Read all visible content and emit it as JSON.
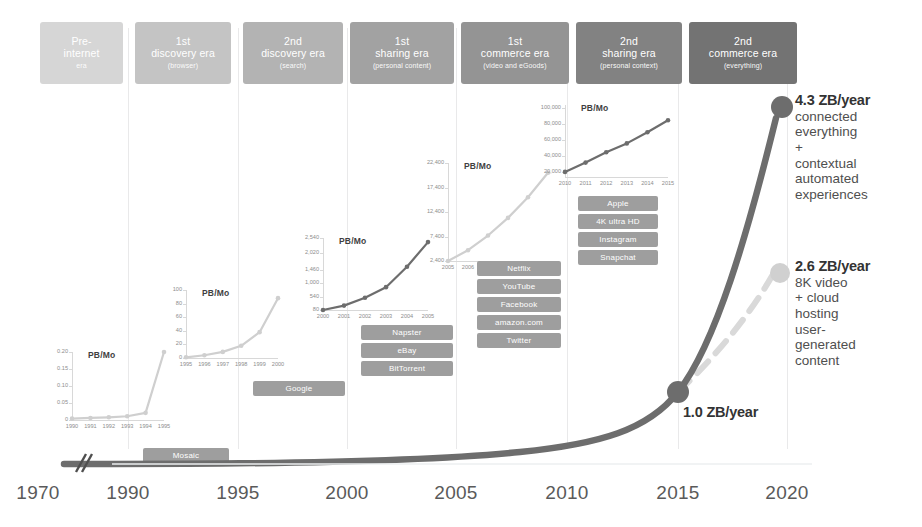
{
  "eras": [
    {
      "top": "Pre-",
      "mid": "internet",
      "sub": "era",
      "color": "#d6d6d6",
      "x": 40,
      "w": 83
    },
    {
      "top": "1st",
      "mid": "discovery era",
      "sub": "(browser)",
      "color": "#c4c4c4",
      "x": 135,
      "w": 96
    },
    {
      "top": "2nd",
      "mid": "discovery era",
      "sub": "(search)",
      "color": "#b3b3b3",
      "x": 243,
      "w": 100
    },
    {
      "top": "1st",
      "mid": "sharing era",
      "sub": "(personal content)",
      "color": "#a2a2a2",
      "x": 350,
      "w": 104
    },
    {
      "top": "1st",
      "mid": "commerce era",
      "sub": "(video and eGoods)",
      "color": "#949494",
      "x": 461,
      "w": 108
    },
    {
      "top": "2nd",
      "mid": "sharing era",
      "sub": "(personal context)",
      "color": "#828282",
      "x": 576,
      "w": 106
    },
    {
      "top": "2nd",
      "mid": "commerce era",
      "sub": "(everything)",
      "color": "#737373",
      "x": 689,
      "w": 108
    }
  ],
  "gridlines": [
    128,
    238,
    347,
    456,
    567,
    678,
    787
  ],
  "axis": {
    "years": [
      "1970",
      "1990",
      "1995",
      "2000",
      "2005",
      "2010",
      "2015",
      "2020"
    ],
    "positions": [
      38,
      128,
      238,
      347,
      456,
      567,
      678,
      787
    ]
  },
  "callouts": [
    {
      "id": "callout-2020-high",
      "value": "4.3 ZB/year",
      "lines": [
        "connected",
        "everything",
        "+",
        "contextual",
        "automated",
        "experiences"
      ],
      "color": "#6d6d6d",
      "x": 795,
      "y": 92,
      "dot_cx": 782,
      "dot_cy": 107,
      "dot_r": 11
    },
    {
      "id": "callout-2020-low",
      "value": "2.6 ZB/year",
      "lines": [
        "8K video",
        "+ cloud",
        "hosting",
        "user-",
        "generated",
        "content"
      ],
      "color": "#d0d0d0",
      "x": 795,
      "y": 258,
      "dot_cx": 780,
      "dot_cy": 273,
      "dot_r": 10
    },
    {
      "id": "callout-2015",
      "value": "1.0 ZB/year",
      "lines": [],
      "color": "#6d6d6d",
      "x": 683,
      "y": 404,
      "dot_cx": 678,
      "dot_cy": 392,
      "dot_r": 11
    }
  ],
  "tag_groups": [
    {
      "name": "group-mosaic",
      "tags": [
        {
          "label": "Mosaic",
          "color": "#9e9e9e"
        }
      ],
      "x": 143,
      "y": 448,
      "w": 86,
      "h": 15,
      "gap": 3
    },
    {
      "name": "group-google",
      "tags": [
        {
          "label": "Google",
          "color": "#9e9e9e"
        }
      ],
      "x": 253,
      "y": 381,
      "w": 92,
      "h": 15,
      "gap": 3
    },
    {
      "name": "group-sharing-1",
      "tags": [
        {
          "label": "Napster",
          "color": "#9e9e9e"
        },
        {
          "label": "eBay",
          "color": "#9e9e9e"
        },
        {
          "label": "BitTorrent",
          "color": "#9e9e9e"
        }
      ],
      "x": 361,
      "y": 325,
      "w": 92,
      "h": 15,
      "gap": 3
    },
    {
      "name": "group-commerce-1",
      "tags": [
        {
          "label": "Netflix",
          "color": "#9e9e9e"
        },
        {
          "label": "YouTube",
          "color": "#9e9e9e"
        },
        {
          "label": "Facebook",
          "color": "#9e9e9e"
        },
        {
          "label": "amazon.com",
          "color": "#9e9e9e"
        },
        {
          "label": "Twitter",
          "color": "#9e9e9e"
        }
      ],
      "x": 477,
      "y": 261,
      "w": 84,
      "h": 15,
      "gap": 3
    },
    {
      "name": "group-sharing-2",
      "tags": [
        {
          "label": "Apple",
          "color": "#9e9e9e"
        },
        {
          "label": "4K ultra HD",
          "color": "#9e9e9e"
        },
        {
          "label": "Instagram",
          "color": "#9e9e9e"
        },
        {
          "label": "Snapchat",
          "color": "#9e9e9e"
        }
      ],
      "x": 578,
      "y": 196,
      "w": 80,
      "h": 15,
      "gap": 3
    }
  ],
  "chart_data": [
    {
      "id": "inset-1",
      "type": "line",
      "title": "PB/Mo",
      "categories": [
        "1990",
        "1991",
        "1992",
        "1993",
        "1994",
        "1995"
      ],
      "values": [
        0.004,
        0.006,
        0.008,
        0.011,
        0.021,
        0.2
      ],
      "yticks": [
        "0",
        "0.05",
        "0.10",
        "0.15",
        "0.20"
      ],
      "ytick_values": [
        0,
        0.05,
        0.1,
        0.15,
        0.2
      ],
      "ylim": [
        0,
        0.2
      ],
      "color": "#cfcfcf",
      "box": {
        "x": 72,
        "y": 352,
        "w": 92,
        "h": 68
      }
    },
    {
      "id": "inset-2",
      "type": "line",
      "title": "PB/Mo",
      "categories": [
        "1995",
        "1996",
        "1997",
        "1998",
        "1999",
        "2000"
      ],
      "values": [
        1,
        4,
        9,
        18,
        38,
        88
      ],
      "yticks": [
        "0",
        "20",
        "40",
        "60",
        "80",
        "100"
      ],
      "ytick_values": [
        0,
        20,
        40,
        60,
        80,
        100
      ],
      "ylim": [
        0,
        100
      ],
      "color": "#cfcfcf",
      "box": {
        "x": 186,
        "y": 290,
        "w": 92,
        "h": 68
      }
    },
    {
      "id": "inset-3",
      "type": "line",
      "title": "PB/Mo",
      "categories": [
        "2000",
        "2001",
        "2002",
        "2003",
        "2004",
        "2005"
      ],
      "values": [
        80,
        230,
        500,
        860,
        1560,
        2400
      ],
      "yticks": [
        "80",
        "540",
        "1,000",
        "1,460",
        "2,020",
        "2,540"
      ],
      "ytick_values": [
        80,
        540,
        1000,
        1460,
        2020,
        2540
      ],
      "ylim": [
        80,
        2540
      ],
      "color": "#6d6d6d",
      "box": {
        "x": 323,
        "y": 238,
        "w": 105,
        "h": 72
      }
    },
    {
      "id": "inset-4",
      "type": "line",
      "title": "PB/Mo",
      "categories": [
        "2005",
        "2006",
        "2007",
        "2008",
        "2009",
        "2010"
      ],
      "values": [
        2400,
        4600,
        7600,
        11200,
        15400,
        20400
      ],
      "yticks": [
        "2,400",
        "7,400",
        "12,400",
        "17,400",
        "22,400"
      ],
      "ytick_values": [
        2400,
        7400,
        12400,
        17400,
        22400
      ],
      "ylim": [
        2400,
        22400
      ],
      "color": "#cfcfcf",
      "box": {
        "x": 448,
        "y": 163,
        "w": 100,
        "h": 98
      }
    },
    {
      "id": "inset-5",
      "type": "line",
      "title": "PB/Mo",
      "categories": [
        "2010",
        "2011",
        "2012",
        "2013",
        "2014",
        "2015"
      ],
      "values": [
        20400,
        32000,
        45000,
        56000,
        70000,
        85000
      ],
      "yticks": [
        "20,000",
        "40,000",
        "60,000",
        "80,000",
        "100,000"
      ],
      "ytick_values": [
        20000,
        40000,
        60000,
        80000,
        100000
      ],
      "ylim": [
        14000,
        104000
      ],
      "color": "#6d6d6d",
      "box": {
        "x": 565,
        "y": 105,
        "w": 103,
        "h": 72
      }
    }
  ],
  "main_curves": {
    "dark_label": "main-growth-curve",
    "light_label": "alternate-growth-curve",
    "dark_color": "#6d6d6d",
    "light_color": "#d9d9d9"
  }
}
